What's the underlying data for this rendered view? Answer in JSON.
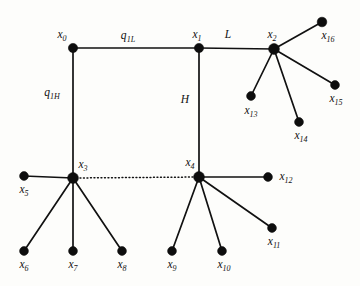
{
  "figure": {
    "type": "node-link-diagram",
    "background_color": "#fdfdfb",
    "ink_color": "#111111",
    "width": 360,
    "height": 286
  },
  "nodes": [
    {
      "id": "x0",
      "base": "x",
      "sub": "0",
      "x": 73,
      "y": 48,
      "r": 4.6,
      "label_dx": -11,
      "label_dy": -13
    },
    {
      "id": "x1",
      "base": "x",
      "sub": "1",
      "x": 199,
      "y": 48,
      "r": 4.6,
      "label_dx": -2,
      "label_dy": -13
    },
    {
      "id": "x2",
      "base": "x",
      "sub": "2",
      "x": 274,
      "y": 49,
      "r": 5.4,
      "label_dx": -2,
      "label_dy": -14
    },
    {
      "id": "x3",
      "base": "x",
      "sub": "3",
      "x": 73,
      "y": 178,
      "r": 5.4,
      "label_dx": 10,
      "label_dy": -13
    },
    {
      "id": "x4",
      "base": "x",
      "sub": "4",
      "x": 199,
      "y": 177,
      "r": 5.4,
      "label_dx": -9,
      "label_dy": -14
    },
    {
      "id": "x5",
      "base": "x",
      "sub": "5",
      "x": 24,
      "y": 176,
      "r": 4.4,
      "label_dx": 0,
      "label_dy": 14
    },
    {
      "id": "x6",
      "base": "x",
      "sub": "6",
      "x": 24,
      "y": 251,
      "r": 4.4,
      "label_dx": 0,
      "label_dy": 14
    },
    {
      "id": "x7",
      "base": "x",
      "sub": "7",
      "x": 73,
      "y": 251,
      "r": 4.4,
      "label_dx": 0,
      "label_dy": 14
    },
    {
      "id": "x8",
      "base": "x",
      "sub": "8",
      "x": 122,
      "y": 251,
      "r": 4.4,
      "label_dx": 0,
      "label_dy": 14
    },
    {
      "id": "x9",
      "base": "x",
      "sub": "9",
      "x": 172,
      "y": 251,
      "r": 4.4,
      "label_dx": 0,
      "label_dy": 14
    },
    {
      "id": "x10",
      "base": "x",
      "sub": "10",
      "x": 222,
      "y": 251,
      "r": 4.4,
      "label_dx": 2,
      "label_dy": 14
    },
    {
      "id": "x11",
      "base": "x",
      "sub": "11",
      "x": 272,
      "y": 228,
      "r": 4.4,
      "label_dx": 2,
      "label_dy": 14
    },
    {
      "id": "x12",
      "base": "x",
      "sub": "12",
      "x": 268,
      "y": 177,
      "r": 4.4,
      "label_dx": 18,
      "label_dy": 0
    },
    {
      "id": "x13",
      "base": "x",
      "sub": "13",
      "x": 251,
      "y": 96,
      "r": 4.4,
      "label_dx": 0,
      "label_dy": 15
    },
    {
      "id": "x14",
      "base": "x",
      "sub": "14",
      "x": 299,
      "y": 122,
      "r": 4.4,
      "label_dx": 2,
      "label_dy": 14
    },
    {
      "id": "x15",
      "base": "x",
      "sub": "15",
      "x": 335,
      "y": 85,
      "r": 4.4,
      "label_dx": 1,
      "label_dy": 14
    },
    {
      "id": "x16",
      "base": "x",
      "sub": "16",
      "x": 322,
      "y": 22,
      "r": 4.8,
      "label_dx": 6,
      "label_dy": 14
    }
  ],
  "edges": [
    {
      "from": "x0",
      "to": "x1",
      "style": "solid"
    },
    {
      "from": "x1",
      "to": "x2",
      "style": "solid"
    },
    {
      "from": "x0",
      "to": "x3",
      "style": "solid"
    },
    {
      "from": "x1",
      "to": "x4",
      "style": "solid"
    },
    {
      "from": "x3",
      "to": "x4",
      "style": "dotted"
    },
    {
      "from": "x3",
      "to": "x5",
      "style": "solid"
    },
    {
      "from": "x3",
      "to": "x6",
      "style": "solid"
    },
    {
      "from": "x3",
      "to": "x7",
      "style": "solid"
    },
    {
      "from": "x3",
      "to": "x8",
      "style": "solid"
    },
    {
      "from": "x4",
      "to": "x9",
      "style": "solid"
    },
    {
      "from": "x4",
      "to": "x10",
      "style": "solid"
    },
    {
      "from": "x4",
      "to": "x11",
      "style": "solid"
    },
    {
      "from": "x4",
      "to": "x12",
      "style": "solid"
    },
    {
      "from": "x2",
      "to": "x13",
      "style": "solid"
    },
    {
      "from": "x2",
      "to": "x14",
      "style": "solid"
    },
    {
      "from": "x2",
      "to": "x15",
      "style": "solid"
    },
    {
      "from": "x2",
      "to": "x16",
      "style": "solid"
    }
  ],
  "edge_labels": [
    {
      "id": "q1L",
      "base": "q",
      "sub": "1L",
      "x": 128,
      "y": 36,
      "for_edge": "x0-x1"
    },
    {
      "id": "L",
      "base": "L",
      "sub": "",
      "x": 228,
      "y": 35,
      "for_edge": "x1-x2"
    },
    {
      "id": "q1H",
      "base": "q",
      "sub": "1H",
      "x": 52,
      "y": 93,
      "for_edge": "x0-x3"
    },
    {
      "id": "H",
      "base": "H",
      "sub": "",
      "x": 185,
      "y": 100,
      "for_edge": "x1-x4"
    }
  ]
}
